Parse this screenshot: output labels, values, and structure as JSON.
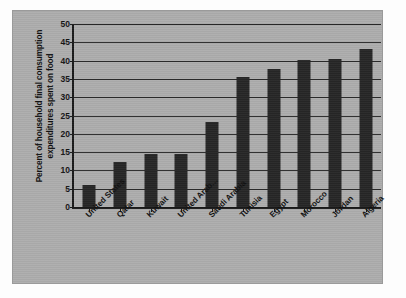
{
  "chart_data": {
    "type": "bar",
    "title": "",
    "subtitle": "",
    "xlabel": "",
    "ylabel": "Percent of household final consumption expenditures spent on food",
    "ylim": [
      0,
      50
    ],
    "ytick_labels": [
      "0",
      "5",
      "10",
      "15",
      "20",
      "25",
      "30",
      "35",
      "40",
      "45",
      "50"
    ],
    "ytick_values": [
      0,
      5,
      10,
      15,
      20,
      25,
      30,
      35,
      40,
      45,
      50
    ],
    "grid": true,
    "legend": null,
    "legend_position": "none",
    "categories": [
      "United States",
      "Qatar",
      "Kuwait",
      "United Arab…",
      "Saudi Arabia",
      "Tunisia",
      "Egypt",
      "Morocco",
      "Jordan",
      "Algeria"
    ],
    "values": [
      6.1,
      12.4,
      14.4,
      14.4,
      23.2,
      35.6,
      37.8,
      40.3,
      40.4,
      43.2
    ],
    "colors": {
      "bar": "#262626",
      "panel_background": "#adadad",
      "axis": "#1a1a1a",
      "gridline": "#2b2b2b",
      "text": "#111111",
      "figure_background": "#ffffff"
    }
  }
}
